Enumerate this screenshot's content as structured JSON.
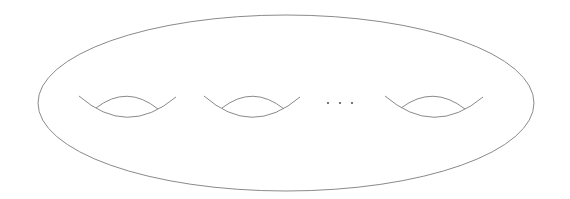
{
  "diagram": {
    "stroke_color": "#8a8a8a",
    "background": "#ffffff",
    "surface": {
      "cx": 286,
      "cy": 103,
      "rx": 248,
      "ry": 88
    },
    "handles": [
      {
        "lower": "M79,96 Q127,138 176,97",
        "upper": "M96,108 Q127,84 158,109"
      },
      {
        "lower": "M204,96 Q252,138 300,97",
        "upper": "M222,108 Q253,84 284,109"
      },
      {
        "lower": "M385,96 Q434,138 483,97",
        "upper": "M401,108 Q433,84 465,109"
      }
    ],
    "ellipsis": {
      "dots": [
        {
          "x": 328,
          "y": 103
        },
        {
          "x": 340,
          "y": 103
        },
        {
          "x": 352,
          "y": 103
        }
      ],
      "label": "..."
    }
  }
}
